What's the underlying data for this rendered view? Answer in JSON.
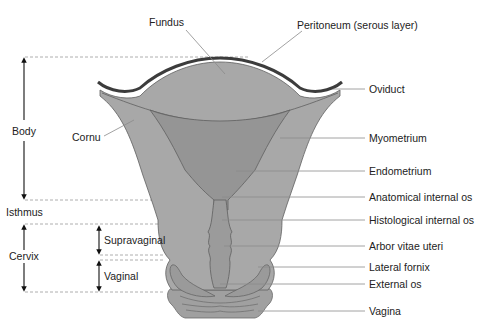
{
  "colors": {
    "tissue": "#a6a6a6",
    "endometrium": "#8f8f8f",
    "outline": "#5a5a5a",
    "serosa": "#3c3c3c",
    "leader": "#8a8a8a",
    "dashed": "#9a9a9a",
    "arrow": "#111111",
    "text": "#222222"
  },
  "labels": {
    "top": [
      {
        "id": "fundus",
        "text": "Fundus"
      },
      {
        "id": "peritoneum",
        "text": "Peritoneum (serous layer)"
      }
    ],
    "right": [
      {
        "id": "oviduct",
        "text": "Oviduct"
      },
      {
        "id": "myometrium",
        "text": "Myometrium"
      },
      {
        "id": "endometrium",
        "text": "Endometrium"
      },
      {
        "id": "anatomical-internal-os",
        "text": "Anatomical internal os"
      },
      {
        "id": "histological-internal-os",
        "text": "Histological internal os"
      },
      {
        "id": "arbor-vitae-uteri",
        "text": "Arbor vitae uteri"
      },
      {
        "id": "lateral-fornix",
        "text": "Lateral fornix"
      },
      {
        "id": "external-os",
        "text": "External os"
      },
      {
        "id": "vagina",
        "text": "Vagina"
      }
    ],
    "left": [
      {
        "id": "cornu",
        "text": "Cornu"
      },
      {
        "id": "body",
        "text": "Body"
      },
      {
        "id": "isthmus",
        "text": "Isthmus"
      },
      {
        "id": "cervix",
        "text": "Cervix"
      },
      {
        "id": "supravaginal",
        "text": "Supravaginal"
      },
      {
        "id": "vaginal",
        "text": "Vaginal"
      }
    ]
  }
}
